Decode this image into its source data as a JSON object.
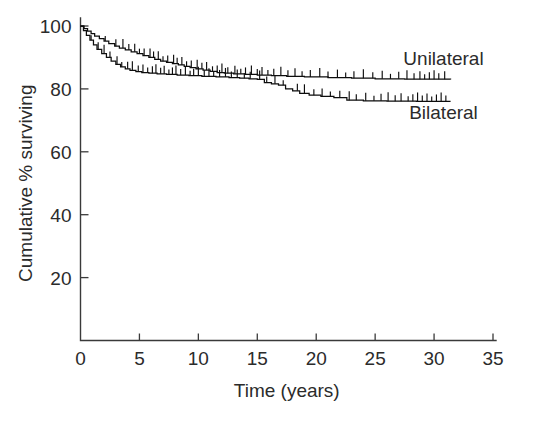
{
  "chart_data": {
    "type": "line",
    "title": "",
    "xlabel": "Time (years)",
    "ylabel": "Cumulative % surviving",
    "xlim": [
      0,
      35
    ],
    "ylim": [
      0,
      100
    ],
    "xticks": [
      0,
      5,
      10,
      15,
      20,
      25,
      30,
      35
    ],
    "xtick_labels": [
      "0",
      "5",
      "10",
      "15",
      "20",
      "25",
      "30",
      "35"
    ],
    "yticks": [
      0,
      20,
      40,
      60,
      80,
      100
    ],
    "ytick_labels": [
      "0",
      "20",
      "40",
      "60",
      "80",
      "100"
    ],
    "grid": false,
    "legend_position": "inline-right",
    "series": [
      {
        "name": "Unilateral",
        "label_x": 30.8,
        "label_y": 87.5,
        "color": "#0d0d0d",
        "points": [
          [
            0.0,
            100.0
          ],
          [
            0.3,
            99.2
          ],
          [
            0.6,
            98.4
          ],
          [
            0.9,
            97.6
          ],
          [
            1.2,
            96.8
          ],
          [
            1.6,
            96.0
          ],
          [
            2.0,
            95.2
          ],
          [
            2.4,
            94.4
          ],
          [
            2.9,
            93.6
          ],
          [
            3.3,
            93.0
          ],
          [
            3.8,
            92.4
          ],
          [
            4.3,
            91.8
          ],
          [
            4.8,
            91.2
          ],
          [
            5.3,
            90.6
          ],
          [
            5.8,
            90.0
          ],
          [
            6.3,
            89.4
          ],
          [
            6.8,
            88.8
          ],
          [
            7.3,
            88.4
          ],
          [
            7.8,
            88.0
          ],
          [
            8.3,
            87.6
          ],
          [
            8.8,
            87.2
          ],
          [
            9.3,
            86.8
          ],
          [
            9.8,
            86.4
          ],
          [
            10.4,
            86.0
          ],
          [
            11.0,
            85.6
          ],
          [
            11.6,
            85.2
          ],
          [
            12.2,
            85.0
          ],
          [
            13.0,
            84.8
          ],
          [
            14.0,
            84.6
          ],
          [
            15.0,
            84.4
          ],
          [
            16.2,
            84.2
          ],
          [
            17.5,
            84.0
          ],
          [
            19.0,
            83.8
          ],
          [
            21.0,
            83.6
          ],
          [
            23.0,
            83.4
          ],
          [
            25.0,
            83.2
          ],
          [
            27.5,
            83.1
          ],
          [
            31.4,
            83.0
          ]
        ],
        "censor_times": [
          2.1,
          3.0,
          3.6,
          4.1,
          4.6,
          5.0,
          5.4,
          5.9,
          6.2,
          6.6,
          7.0,
          7.4,
          7.9,
          8.2,
          8.6,
          9.0,
          9.4,
          9.9,
          10.3,
          10.7,
          11.2,
          11.6,
          12.0,
          12.5,
          13.1,
          13.6,
          14.0,
          14.5,
          15.0,
          15.4,
          15.9,
          16.4,
          17.0,
          17.6,
          18.2,
          18.8,
          19.5,
          20.3,
          21.0,
          21.8,
          22.5,
          23.2,
          24.0,
          24.8,
          25.6,
          26.3,
          27.0,
          27.7,
          28.3,
          28.8,
          29.2,
          29.6,
          30.0,
          30.4,
          30.9
        ]
      },
      {
        "name": "Bilateral",
        "label_x": 30.8,
        "label_y": 70.5,
        "color": "#0d0d0d",
        "points": [
          [
            0.0,
            100.0
          ],
          [
            0.25,
            98.5
          ],
          [
            0.5,
            97.0
          ],
          [
            0.8,
            95.5
          ],
          [
            1.1,
            94.0
          ],
          [
            1.4,
            92.6
          ],
          [
            1.8,
            91.2
          ],
          [
            2.2,
            90.0
          ],
          [
            2.6,
            88.8
          ],
          [
            3.0,
            87.8
          ],
          [
            3.4,
            87.0
          ],
          [
            3.8,
            86.4
          ],
          [
            4.2,
            85.9
          ],
          [
            4.7,
            85.5
          ],
          [
            5.2,
            85.2
          ],
          [
            5.8,
            85.0
          ],
          [
            6.5,
            84.8
          ],
          [
            7.3,
            84.6
          ],
          [
            8.2,
            84.4
          ],
          [
            9.2,
            84.2
          ],
          [
            10.3,
            84.0
          ],
          [
            11.5,
            83.8
          ],
          [
            12.6,
            83.6
          ],
          [
            13.5,
            83.4
          ],
          [
            14.3,
            83.2
          ],
          [
            15.0,
            83.0
          ],
          [
            15.6,
            82.0
          ],
          [
            16.2,
            81.6
          ],
          [
            16.8,
            81.2
          ],
          [
            17.4,
            80.0
          ],
          [
            18.0,
            79.4
          ],
          [
            18.6,
            78.6
          ],
          [
            19.4,
            78.0
          ],
          [
            20.4,
            77.6
          ],
          [
            21.5,
            77.2
          ],
          [
            22.6,
            76.4
          ],
          [
            24.0,
            76.2
          ],
          [
            26.0,
            76.1
          ],
          [
            28.5,
            76.0
          ],
          [
            31.4,
            76.0
          ]
        ],
        "censor_times": [
          0.9,
          1.5,
          2.0,
          2.5,
          3.1,
          3.5,
          4.0,
          4.4,
          4.9,
          5.3,
          5.7,
          6.1,
          6.4,
          6.8,
          7.1,
          7.5,
          7.8,
          8.1,
          8.5,
          8.9,
          9.3,
          9.6,
          10.0,
          10.5,
          10.9,
          11.3,
          11.8,
          12.3,
          12.8,
          13.3,
          13.9,
          14.4,
          15.2,
          15.8,
          16.5,
          17.2,
          18.4,
          19.0,
          19.8,
          20.5,
          21.2,
          22.0,
          22.8,
          23.4,
          24.2,
          24.9,
          25.5,
          26.1,
          26.7,
          27.2,
          27.8,
          28.2,
          28.6,
          29.0,
          29.4,
          29.8,
          30.2,
          30.6,
          31.0
        ]
      }
    ]
  }
}
